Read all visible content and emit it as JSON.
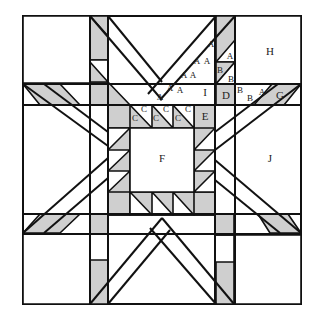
{
  "diagram": {
    "type": "quilt-block-piecing-diagram",
    "pattern": "eight-pointed feathered star",
    "fill_colors": {
      "shaded": "#cfcfcf",
      "unshaded": "#ffffff",
      "outline": "#111111"
    },
    "labels": {
      "A1": "A",
      "A2": "A",
      "A3": "A",
      "A4": "A",
      "A5": "A",
      "A6": "A",
      "A7": "A",
      "A8": "A",
      "A9": "A",
      "A10": "A",
      "B1": "B",
      "B2": "B",
      "B3": "B",
      "B4": "B",
      "C1": "C",
      "C2": "C",
      "C3": "C",
      "C4": "C",
      "C5": "C",
      "C6": "C",
      "D": "D",
      "E": "E",
      "F": "F",
      "G": "G",
      "H": "H",
      "I": "I",
      "J": "J"
    }
  }
}
